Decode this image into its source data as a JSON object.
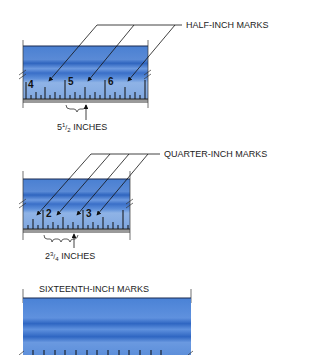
{
  "panels": [
    {
      "id": "half",
      "callout": "HALF-INCH MARKS",
      "numbers": [
        "4",
        "5",
        "6"
      ],
      "measurement": {
        "whole": "5",
        "num": "1",
        "den": "2",
        "unit": "INCHES"
      }
    },
    {
      "id": "quarter",
      "callout": "QUARTER-INCH MARKS",
      "numbers": [
        "2",
        "3"
      ],
      "measurement": {
        "whole": "2",
        "num": "3",
        "den": "4",
        "unit": "INCHES"
      }
    },
    {
      "id": "sixteenth",
      "callout": "SIXTEENTH-INCH MARKS"
    }
  ],
  "colors": {
    "ruler_dark": "#3f78cc",
    "ruler_light": "#7fa7e0",
    "ruler_stripe": "#2f65bf",
    "edge_gray": "#9a9a9a"
  }
}
